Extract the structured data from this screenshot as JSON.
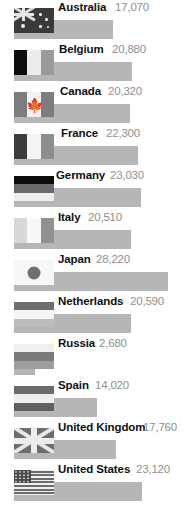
{
  "chart_data": {
    "type": "bar",
    "title": "",
    "xlabel": "",
    "ylabel": "",
    "orientation": "horizontal",
    "grid": false,
    "legend": false,
    "xlim": [
      0,
      28220
    ],
    "categories": [
      "Australia",
      "Belgium",
      "Canada",
      "France",
      "Germany",
      "Italy",
      "Japan",
      "Netherlands",
      "Russia",
      "Spain",
      "United Kingdom",
      "United States"
    ],
    "values": [
      17070,
      20880,
      20320,
      22300,
      23030,
      20510,
      28220,
      20590,
      2680,
      14020,
      17760,
      23120
    ],
    "value_labels": [
      "17,070",
      "20,880",
      "20,320",
      "22,300",
      "23,030",
      "20,510",
      "28,220",
      "20,590",
      "2,680",
      "14,020",
      "17,760",
      "23,120"
    ],
    "bar_color": "#b6b6b6",
    "label_color": "#101010",
    "value_color": "#8f8f8f"
  },
  "rows": [
    {
      "country": "Australia",
      "value": "17,070",
      "flag": "australia-flag",
      "top": 0,
      "bar_w": 99,
      "label_x": 58,
      "value_x": 115
    },
    {
      "country": "Belgium",
      "value": "20,880",
      "flag": "belgium-flag",
      "top": 42,
      "bar_w": 118,
      "label_x": 59,
      "value_x": 112
    },
    {
      "country": "Canada",
      "value": "20,320",
      "flag": "canada-flag",
      "top": 84,
      "bar_w": 116,
      "label_x": 60,
      "value_x": 108
    },
    {
      "country": "France",
      "value": "22,300",
      "flag": "france-flag",
      "top": 126,
      "bar_w": 124,
      "label_x": 61,
      "value_x": 106
    },
    {
      "country": "Germany",
      "value": "23,030",
      "flag": "germany-flag",
      "top": 168,
      "bar_w": 127,
      "label_x": 56,
      "value_x": 110
    },
    {
      "country": "Italy",
      "value": "20,510",
      "flag": "italy-flag",
      "top": 210,
      "bar_w": 117,
      "label_x": 58,
      "value_x": 88
    },
    {
      "country": "Japan",
      "value": "28,220",
      "flag": "japan-flag",
      "top": 252,
      "bar_w": 154,
      "label_x": 58,
      "value_x": 96
    },
    {
      "country": "Netherlands",
      "value": "20,590",
      "flag": "netherlands-flag",
      "top": 294,
      "bar_w": 117,
      "label_x": 58,
      "value_x": 130
    },
    {
      "country": "Russia",
      "value": "2,680",
      "flag": "russia-flag",
      "top": 336,
      "bar_w": 21,
      "label_x": 58,
      "value_x": 99
    },
    {
      "country": "Spain",
      "value": "14,020",
      "flag": "spain-flag",
      "top": 378,
      "bar_w": 83,
      "label_x": 58,
      "value_x": 95
    },
    {
      "country": "United Kingdom",
      "value": "17,760",
      "flag": "uk-flag",
      "top": 420,
      "bar_w": 102,
      "label_x": 58,
      "value_x": 143
    },
    {
      "country": "United States",
      "value": "23,120",
      "flag": "us-flag",
      "top": 462,
      "bar_w": 128,
      "label_x": 58,
      "value_x": 136
    }
  ],
  "caption": {
    "text": "",
    "visible": false
  }
}
